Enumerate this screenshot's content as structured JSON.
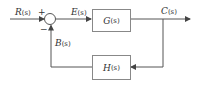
{
  "diagram": {
    "type": "feedback-control-block-diagram",
    "input_signal": {
      "name": "R",
      "arg": "(s)"
    },
    "error_signal": {
      "name": "E",
      "arg": "(s)"
    },
    "output_signal": {
      "name": "C",
      "arg": "(s)"
    },
    "feedback_signal": {
      "name": "B",
      "arg": "(s)"
    },
    "forward_block": {
      "name": "G",
      "arg": "(s)"
    },
    "feedback_block": {
      "name": "H",
      "arg": "(s)"
    },
    "junction_signs": {
      "input": "+",
      "feedback": "−"
    },
    "colors": {
      "line": "#555555",
      "text": "#333333"
    }
  }
}
